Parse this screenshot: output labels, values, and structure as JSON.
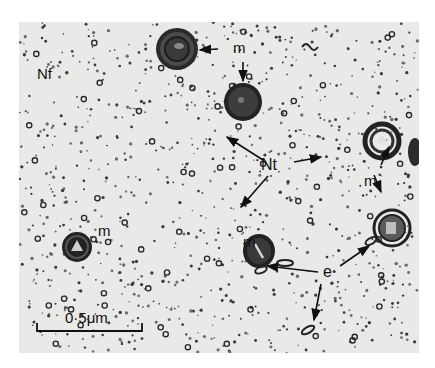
{
  "figure": {
    "type": "electron micrograph",
    "labels": {
      "neurofilaments": "Nf",
      "neurotubules": "Nt",
      "mitochondria": "m",
      "endoplasmic_reticulum": "e"
    },
    "scale_bar": {
      "label": "0·5μm",
      "length_um": 0.5
    },
    "colors": {
      "background": "#e9e9e7",
      "ink": "#111111"
    }
  }
}
